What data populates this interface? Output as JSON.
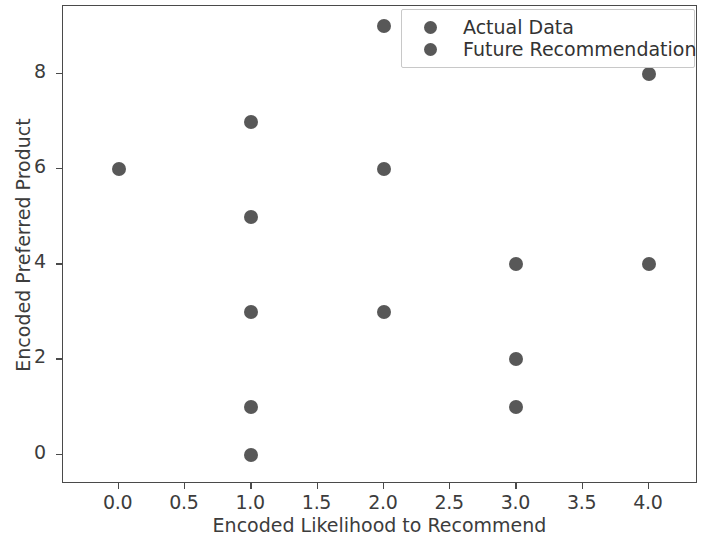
{
  "chart_data": {
    "type": "scatter",
    "title": "",
    "xlabel": "Encoded Likelihood to Recommend",
    "ylabel": "Encoded Preferred Product",
    "xlim": [
      -0.42,
      4.37
    ],
    "ylim": [
      -0.62,
      9.43
    ],
    "grid": false,
    "legend_position": "upper right",
    "xticks": [
      "0.0",
      "0.5",
      "1.0",
      "1.5",
      "2.0",
      "2.5",
      "3.0",
      "3.5",
      "4.0"
    ],
    "xtick_values": [
      0.0,
      0.5,
      1.0,
      1.5,
      2.0,
      2.5,
      3.0,
      3.5,
      4.0
    ],
    "yticks": [
      "0",
      "2",
      "4",
      "6",
      "8"
    ],
    "ytick_values": [
      0,
      2,
      4,
      6,
      8
    ],
    "marker_color": "#585858",
    "series": [
      {
        "name": "Actual Data",
        "color": "#585858",
        "points": [
          {
            "x": 0,
            "y": 6
          },
          {
            "x": 1,
            "y": 7
          },
          {
            "x": 1,
            "y": 5
          },
          {
            "x": 1,
            "y": 3
          },
          {
            "x": 1,
            "y": 1
          },
          {
            "x": 1,
            "y": 0
          },
          {
            "x": 2,
            "y": 9
          },
          {
            "x": 2,
            "y": 6
          },
          {
            "x": 2,
            "y": 3
          },
          {
            "x": 3,
            "y": 4
          },
          {
            "x": 3,
            "y": 2
          },
          {
            "x": 3,
            "y": 1
          },
          {
            "x": 4,
            "y": 8
          },
          {
            "x": 4,
            "y": 4
          }
        ]
      },
      {
        "name": "Future Recommendation",
        "color": "#585858",
        "points": []
      }
    ]
  },
  "legend": {
    "entries": [
      {
        "label": "Actual Data",
        "marker": "circle-marker"
      },
      {
        "label": "Future Recommendation",
        "marker": "circle-marker"
      }
    ]
  }
}
